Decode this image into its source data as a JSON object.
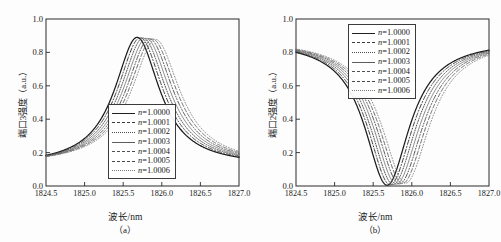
{
  "figure": {
    "panels": [
      {
        "id": "a",
        "subcaption": "（a）",
        "ylabel": "端口3强度（a.u.）",
        "xlabel": "波长/nm"
      },
      {
        "id": "b",
        "subcaption": "（b）",
        "ylabel": "端口2强度（a.u.）",
        "xlabel": "波长/nm"
      }
    ]
  },
  "chart_data": [
    {
      "type": "line",
      "panel": "a",
      "title": "",
      "xlabel": "波长/nm",
      "ylabel": "端口3强度（a.u.）",
      "xlim": [
        1824.5,
        1827.0
      ],
      "ylim": [
        0.0,
        1.0
      ],
      "xticks": [
        1824.5,
        1825.0,
        1825.5,
        1826.0,
        1826.5,
        1827.0
      ],
      "yticks": [
        0.0,
        0.2,
        0.4,
        0.6,
        0.8,
        1.0
      ],
      "xticklabels": [
        "1824.5",
        "1825.0",
        "1825.5",
        "1826.0",
        "1826.5",
        "1827.0"
      ],
      "yticklabels": [
        "0.0",
        "0.2",
        "0.4",
        "0.6",
        "0.8",
        "1.0"
      ],
      "grid": false,
      "legend_position": "center",
      "peak_value": 0.89,
      "baseline_value": 0.12,
      "hwhm_nm": 0.36,
      "series": [
        {
          "name": "n=1.0000",
          "center": 1825.68,
          "peak": 0.89,
          "baseline": 0.12,
          "hwhm": 0.355,
          "style": "solid",
          "width": 1.25,
          "color": "#1c1c1c"
        },
        {
          "name": "n=1.0001",
          "center": 1825.72,
          "peak": 0.888,
          "baseline": 0.121,
          "hwhm": 0.36,
          "style": "dashdot",
          "width": 1.0,
          "color": "#3a3a3a"
        },
        {
          "name": "n=1.0002",
          "center": 1825.76,
          "peak": 0.886,
          "baseline": 0.122,
          "hwhm": 0.364,
          "style": "dotted",
          "width": 1.0,
          "color": "#4a4a4a"
        },
        {
          "name": "n=1.0003",
          "center": 1825.8,
          "peak": 0.884,
          "baseline": 0.123,
          "hwhm": 0.368,
          "style": "thin-solid",
          "width": 0.75,
          "color": "#606060"
        },
        {
          "name": "n=1.0004",
          "center": 1825.84,
          "peak": 0.882,
          "baseline": 0.124,
          "hwhm": 0.372,
          "style": "dashdotdot",
          "width": 1.0,
          "color": "#555555"
        },
        {
          "name": "n=1.0005",
          "center": 1825.88,
          "peak": 0.88,
          "baseline": 0.125,
          "hwhm": 0.376,
          "style": "dashed",
          "width": 1.0,
          "color": "#6a6a6a"
        },
        {
          "name": "n=1.0006",
          "center": 1825.92,
          "peak": 0.878,
          "baseline": 0.126,
          "hwhm": 0.38,
          "style": "fine-dotted",
          "width": 0.85,
          "color": "#777777"
        }
      ],
      "legend": [
        {
          "label": "n=1.0000",
          "prefix": "n",
          "value": "=1.0000",
          "style": "solid"
        },
        {
          "label": "n=1.0001",
          "prefix": "n",
          "value": "=1.0001",
          "style": "dashdot"
        },
        {
          "label": "n=1.0002",
          "prefix": "n",
          "value": "=1.0002",
          "style": "dotted"
        },
        {
          "label": "n=1.0003",
          "prefix": "n",
          "value": "=1.0003",
          "style": "thin-solid"
        },
        {
          "label": "n=1.0004",
          "prefix": "n",
          "value": "=1.0004",
          "style": "dashdotdot"
        },
        {
          "label": "n=1.0005",
          "prefix": "n",
          "value": "=1.0005",
          "style": "dashed"
        },
        {
          "label": "n=1.0006",
          "prefix": "n",
          "value": "=1.0006",
          "style": "fine-dotted"
        }
      ]
    },
    {
      "type": "line",
      "panel": "b",
      "title": "",
      "xlabel": "波长/nm",
      "ylabel": "端口2强度（a.u.）",
      "xlim": [
        1824.5,
        1827.0
      ],
      "ylim": [
        0.0,
        1.0
      ],
      "xticks": [
        1824.5,
        1825.0,
        1825.5,
        1826.0,
        1826.5,
        1827.0
      ],
      "yticks": [
        0.0,
        0.2,
        0.4,
        0.6,
        0.8,
        1.0
      ],
      "xticklabels": [
        "1824.5",
        "1825.0",
        "1825.5",
        "1826.0",
        "1826.5",
        "1827.0"
      ],
      "yticklabels": [
        "0.0",
        "0.2",
        "0.4",
        "0.6",
        "0.8",
        "1.0"
      ],
      "grid": false,
      "legend_position": "upper center",
      "dip_value": 0.005,
      "baseline_value": 0.875,
      "hwhm_nm": 0.36,
      "series": [
        {
          "name": "n=1.0000",
          "center": 1825.68,
          "dip": 0.005,
          "baseline": 0.872,
          "hwhm": 0.355,
          "style": "solid",
          "width": 1.25,
          "color": "#1c1c1c"
        },
        {
          "name": "n=1.0001",
          "center": 1825.72,
          "dip": 0.007,
          "baseline": 0.873,
          "hwhm": 0.36,
          "style": "dashdot",
          "width": 1.0,
          "color": "#3a3a3a"
        },
        {
          "name": "n=1.0002",
          "center": 1825.76,
          "dip": 0.009,
          "baseline": 0.874,
          "hwhm": 0.364,
          "style": "dotted",
          "width": 1.0,
          "color": "#4a4a4a"
        },
        {
          "name": "n=1.0003",
          "center": 1825.8,
          "dip": 0.011,
          "baseline": 0.875,
          "hwhm": 0.368,
          "style": "thin-solid",
          "width": 0.75,
          "color": "#606060"
        },
        {
          "name": "n=1.0004",
          "center": 1825.84,
          "dip": 0.013,
          "baseline": 0.876,
          "hwhm": 0.372,
          "style": "dashdotdot",
          "width": 1.0,
          "color": "#555555"
        },
        {
          "name": "n=1.0005",
          "center": 1825.88,
          "dip": 0.015,
          "baseline": 0.877,
          "hwhm": 0.376,
          "style": "dashed",
          "width": 1.0,
          "color": "#6a6a6a"
        },
        {
          "name": "n=1.0006",
          "center": 1825.92,
          "dip": 0.017,
          "baseline": 0.878,
          "hwhm": 0.38,
          "style": "fine-dotted",
          "width": 0.85,
          "color": "#777777"
        }
      ],
      "legend": [
        {
          "label": "n=1.0000",
          "prefix": "n",
          "value": "=1.0000",
          "style": "solid"
        },
        {
          "label": "n=1.0001",
          "prefix": "n",
          "value": "=1.0001",
          "style": "dashdot"
        },
        {
          "label": "n=1.0002",
          "prefix": "n",
          "value": "=1.0002",
          "style": "dotted"
        },
        {
          "label": "n=1.0003",
          "prefix": "n",
          "value": "=1.0003",
          "style": "thin-solid"
        },
        {
          "label": "n=1.0004",
          "prefix": "n",
          "value": "=1.0004",
          "style": "dashdotdot"
        },
        {
          "label": "n=1.0005",
          "prefix": "n",
          "value": "=1.0005",
          "style": "dashed"
        },
        {
          "label": "n=1.0006",
          "prefix": "n",
          "value": "=1.0006",
          "style": "fine-dotted"
        }
      ]
    }
  ]
}
